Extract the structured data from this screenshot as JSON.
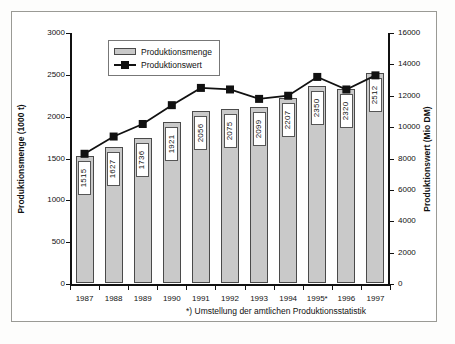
{
  "chart_data": {
    "type": "bar",
    "title": "",
    "categories": [
      "1987",
      "1988",
      "1989",
      "1990",
      "1991",
      "1992",
      "1993",
      "1994",
      "1995*",
      "1996",
      "1997"
    ],
    "xlabel": "",
    "series": [
      {
        "name": "Produktionsmenge",
        "type": "bar",
        "axis": "left",
        "unit": "1000 t",
        "values": [
          1515,
          1627,
          1736,
          1921,
          2056,
          2075,
          2099,
          2207,
          2350,
          2320,
          2512
        ]
      },
      {
        "name": "Produktionswert",
        "type": "line",
        "axis": "right",
        "unit": "Mio DM",
        "values": [
          8300,
          9400,
          10200,
          11400,
          12500,
          12400,
          11800,
          12000,
          13200,
          12400,
          13300
        ]
      }
    ],
    "left_axis": {
      "label": "Produktionsmenge (1000 t)",
      "ticks": [
        "0",
        "500",
        "1000",
        "1500",
        "2000",
        "2500",
        "3000"
      ],
      "min": 0,
      "max": 3000,
      "step": 500
    },
    "right_axis": {
      "label": "Produktionswert (Mio DM)",
      "ticks": [
        "0",
        "2000",
        "4000",
        "6000",
        "8000",
        "10000",
        "12000",
        "14000",
        "16000"
      ],
      "min": 0,
      "max": 16000,
      "step": 2000
    },
    "grid": false,
    "legend": {
      "position": "top-left",
      "entries": [
        "Produktionsmenge",
        "Produktionswert"
      ]
    },
    "annotations": {
      "footnote": "*) Umstellung der amtlichen Produktionsstatistik"
    },
    "colors": {
      "bar_fill": "#c9c9c9",
      "bar_border": "#4a4a4a",
      "line": "#111111",
      "marker": "#111111",
      "frame": "#9a9a95",
      "background": "#ffffff"
    }
  }
}
